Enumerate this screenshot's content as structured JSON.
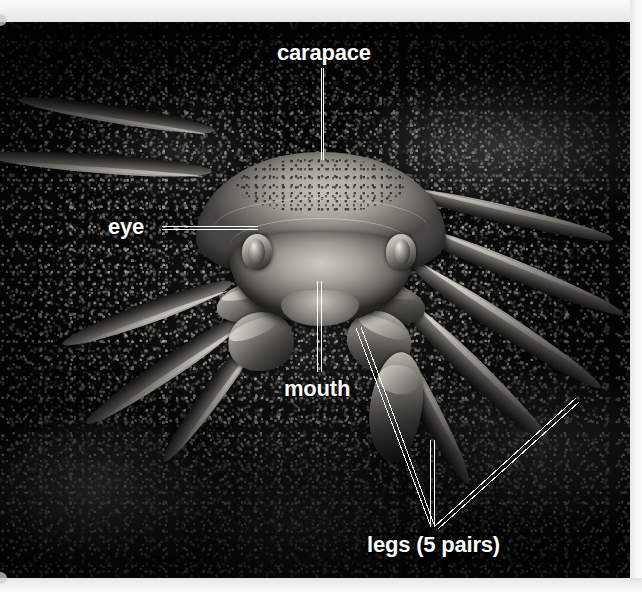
{
  "figure": {
    "view": "front view",
    "style": "black-and-white photograph",
    "label_color": "#ffffff",
    "leader_line_color": "#ffffff",
    "background_color": "#070707",
    "paper_color": "#f7f6f3"
  },
  "labels": [
    {
      "id": "carapace",
      "text": "carapace",
      "x": 277,
      "y": 42,
      "leader": {
        "type": "vertical",
        "from": [
          322,
          68
        ],
        "to": [
          322,
          160
        ]
      }
    },
    {
      "id": "eye",
      "text": "eye",
      "x": 108,
      "y": 216,
      "leader": {
        "type": "horizontal",
        "from": [
          162,
          228
        ],
        "to": [
          258,
          228
        ]
      }
    },
    {
      "id": "mouth",
      "text": "mouth",
      "x": 284,
      "y": 378,
      "leader": {
        "type": "vertical",
        "from": [
          319,
          281
        ],
        "to": [
          319,
          372
        ]
      }
    },
    {
      "id": "legs",
      "text": "legs (5 pairs)",
      "x": 367,
      "y": 534,
      "leader": {
        "type": "multi-branch",
        "converge": [
          432,
          527
        ],
        "branches": [
          [
            356,
            328
          ],
          [
            432,
            440
          ],
          [
            576,
            399
          ]
        ]
      }
    }
  ],
  "anatomy_parts": [
    "carapace",
    "eye",
    "mouth",
    "legs (5 pairs)"
  ]
}
